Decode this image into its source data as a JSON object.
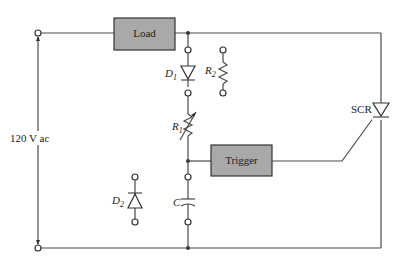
{
  "diagram": {
    "source": {
      "label": "120 V ac"
    },
    "load": {
      "label": "Load"
    },
    "trigger": {
      "label": "Trigger"
    },
    "components": {
      "d1": {
        "label": "D",
        "sub": "1"
      },
      "d2": {
        "label": "D",
        "sub": "2"
      },
      "r1": {
        "label": "R",
        "sub": "1"
      },
      "r2": {
        "label": "R",
        "sub": "2"
      },
      "c": {
        "label": "C"
      },
      "scr": {
        "label": "SCR"
      }
    },
    "colors": {
      "box_fill": "#a9a9a9",
      "wire": "#4a4a4a",
      "background": "#ffffff"
    }
  }
}
